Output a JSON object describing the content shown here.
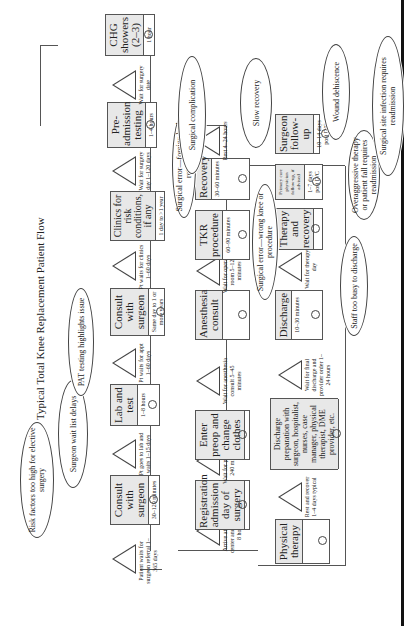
{
  "title": "Typical Total Knee Replacement Patient Flow",
  "row1": {
    "waits": [
      {
        "text": "Patient waits for surgeon referral 1–365 days"
      },
      {
        "text": "Pt goes to lab and waits 1–15 days"
      },
      {
        "text": "Pt waits for appt 1–60 days"
      },
      {
        "text": "Pt waits for clinics 1–60 days"
      },
      {
        "text": "Wait for surgery day 1–120 days"
      },
      {
        "text": "Wait for surgery date"
      }
    ],
    "steps": [
      {
        "title": "Consult with surgeon",
        "time": "30–120 minutes"
      },
      {
        "title": "Lab and test",
        "time": "1–8 hours"
      },
      {
        "title": "Consult with surgeon",
        "time": "Same day to 1 or more years"
      },
      {
        "title": "Clinics for risk conditions, if any",
        "time": "1 day to >1 year"
      },
      {
        "title": "Pre-admission testing",
        "time": "1–4 hours"
      },
      {
        "title": "CHG showers (2–3)",
        "time": "1 hour"
      }
    ]
  },
  "row2": {
    "waits": [
      {
        "text": "Arrive at surgery center and wait 1–8 hours"
      },
      {
        "text": "Wait for preop 10–240 minutes"
      },
      {
        "text": "Wait for anesthesia consult 5–45 minutes"
      },
      {
        "text": "Wait for operating room 5–120 minutes"
      },
      {
        "text": "Rest 4–24 hours"
      }
    ],
    "steps": [
      {
        "title": "Registration admission day of surgery",
        "time": ""
      },
      {
        "title": "Enter preop and change clothes",
        "time": ""
      },
      {
        "title": "Anesthesia consult",
        "time": ""
      },
      {
        "title": "TKR procedure",
        "time": "60–90 minutes"
      },
      {
        "title": "Recovery",
        "time": "30–60 minutes"
      }
    ]
  },
  "row3": {
    "waits": [
      {
        "text": "Rest and recover 1–4 days typical"
      },
      {
        "text": "Wait for final discharge and provider order 1–24 hours"
      },
      {
        "text": "Wait for therapy 1 day"
      }
    ],
    "steps": [
      {
        "title": "Physical therapy",
        "time": ""
      },
      {
        "title": "Discharge preparation with surgeon, hospitalist, nurses, case manager, physical therapist, DME provider, etc.",
        "time": ""
      },
      {
        "title": "Discharge",
        "time": "10–30 minutes"
      },
      {
        "title": "Therapy and recovery",
        "time": ""
      },
      {
        "title": "Primary care physician follow-up, if advised",
        "time": "1–7 days post D/C"
      },
      {
        "title": "Surgeon follow-up",
        "time": "10–14 days post D/C"
      }
    ]
  },
  "clouds": [
    {
      "text": "Risk factors too high for elective surgery"
    },
    {
      "text": "Surgeon wait list delays"
    },
    {
      "text": "PAT testing highlights issue"
    },
    {
      "text": "Surgical error—foreign body retained"
    },
    {
      "text": "Surgical complication"
    },
    {
      "text": "Slow recovery"
    },
    {
      "text": "Surgical error—wrong knee or procedure"
    },
    {
      "text": "Staff too busy to discharge"
    },
    {
      "text": "Overaggressive therapy or patient fall requires readmission"
    },
    {
      "text": "Wound dehiscence"
    },
    {
      "text": "Surgical site infection requires readmission"
    }
  ]
}
